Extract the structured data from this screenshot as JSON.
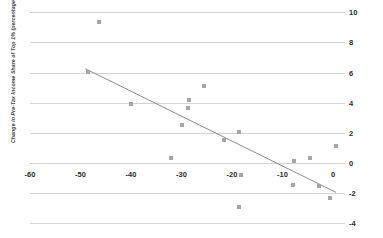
{
  "chart_data": {
    "type": "scatter",
    "title": "",
    "xlabel": "",
    "ylabel": "Change in Pre-Tax Income Share of Top 1% (percentage points)",
    "xlim": [
      -60,
      2
    ],
    "ylim": [
      -4,
      10
    ],
    "xticks": [
      -60,
      -50,
      -40,
      -30,
      -20,
      -10,
      0
    ],
    "xtick_labels": [
      "-60",
      "-50",
      "-40",
      "-30",
      "-20",
      "-10",
      "0"
    ],
    "yticks": [
      10,
      8,
      6,
      4,
      2,
      0,
      -2,
      -4
    ],
    "ytick_labels": [
      "10",
      "8",
      "6",
      "4",
      "2",
      "0",
      "-2",
      "-4"
    ],
    "grid": "horizontal",
    "y_axis_position": "right",
    "legend": "none",
    "marker_color": "#a6a6a6",
    "gridline_color": "#d4d4d4",
    "trendline_color": "#8c8c8c",
    "points": [
      {
        "x": -46.4,
        "y": 9.35
      },
      {
        "x": -48.5,
        "y": 6.05
      },
      {
        "x": -40.0,
        "y": 3.9
      },
      {
        "x": -25.5,
        "y": 5.1
      },
      {
        "x": -28.5,
        "y": 4.15
      },
      {
        "x": -28.8,
        "y": 3.65
      },
      {
        "x": -30.0,
        "y": 2.55
      },
      {
        "x": -18.6,
        "y": 2.05
      },
      {
        "x": -21.5,
        "y": 1.55
      },
      {
        "x": -32.0,
        "y": 0.35
      },
      {
        "x": -7.8,
        "y": 0.15
      },
      {
        "x": -4.5,
        "y": 0.3
      },
      {
        "x": 0.6,
        "y": 1.15
      },
      {
        "x": -18.3,
        "y": -0.8
      },
      {
        "x": -8.0,
        "y": -1.45
      },
      {
        "x": -2.8,
        "y": -1.55
      },
      {
        "x": -0.5,
        "y": -2.35
      },
      {
        "x": -18.7,
        "y": -2.9
      }
    ],
    "trendline": {
      "x_start": -49.0,
      "y_start": 6.25,
      "x_end": 0.6,
      "y_end": -1.95
    }
  }
}
